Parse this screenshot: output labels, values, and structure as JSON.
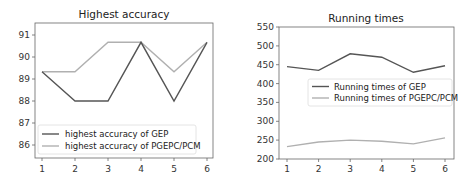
{
  "chart_data": [
    {
      "type": "line",
      "title": "Highest accuracy",
      "xlabel": "",
      "ylabel": "",
      "x": [
        1,
        2,
        3,
        4,
        5,
        6
      ],
      "ylim": [
        85.4,
        91.6
      ],
      "yticks": [
        86,
        87,
        88,
        89,
        90,
        91
      ],
      "grid": false,
      "legend_position": "lower left",
      "series": [
        {
          "name": "highest accuracy of GEP",
          "color": "#555555",
          "values": [
            89.33,
            88.0,
            88.0,
            90.67,
            88.0,
            90.67
          ]
        },
        {
          "name": "highest accuracy of PGEPC/PCM",
          "color": "#b0b0b0",
          "values": [
            89.33,
            89.33,
            90.67,
            90.67,
            89.33,
            90.67
          ]
        }
      ]
    },
    {
      "type": "line",
      "title": "Running times",
      "xlabel": "",
      "ylabel": "",
      "x": [
        1,
        2,
        3,
        4,
        5,
        6
      ],
      "ylim": [
        200,
        550
      ],
      "yticks": [
        200,
        250,
        300,
        350,
        400,
        450,
        500,
        550
      ],
      "grid": false,
      "legend_position": "center right",
      "series": [
        {
          "name": "Running times of GEP",
          "color": "#555555",
          "values": [
            445,
            435,
            479,
            470,
            430,
            447
          ]
        },
        {
          "name": "Running times of PGEPC/PCM",
          "color": "#b0b0b0",
          "values": [
            233,
            245,
            250,
            247,
            240,
            256
          ]
        }
      ]
    }
  ],
  "left": {
    "title": "Highest accuracy",
    "yticks": [
      "86",
      "87",
      "88",
      "89",
      "90",
      "91"
    ],
    "xticks": [
      "1",
      "2",
      "3",
      "4",
      "5",
      "6"
    ],
    "legend": [
      "highest accuracy of GEP",
      "highest accuracy of PGEPC/PCM"
    ]
  },
  "right": {
    "title": "Running times",
    "yticks": [
      "200",
      "250",
      "300",
      "350",
      "400",
      "450",
      "500",
      "550"
    ],
    "xticks": [
      "1",
      "2",
      "3",
      "4",
      "5",
      "6"
    ],
    "legend": [
      "Running times of GEP",
      "Running times of PGEPC/PCM"
    ]
  }
}
